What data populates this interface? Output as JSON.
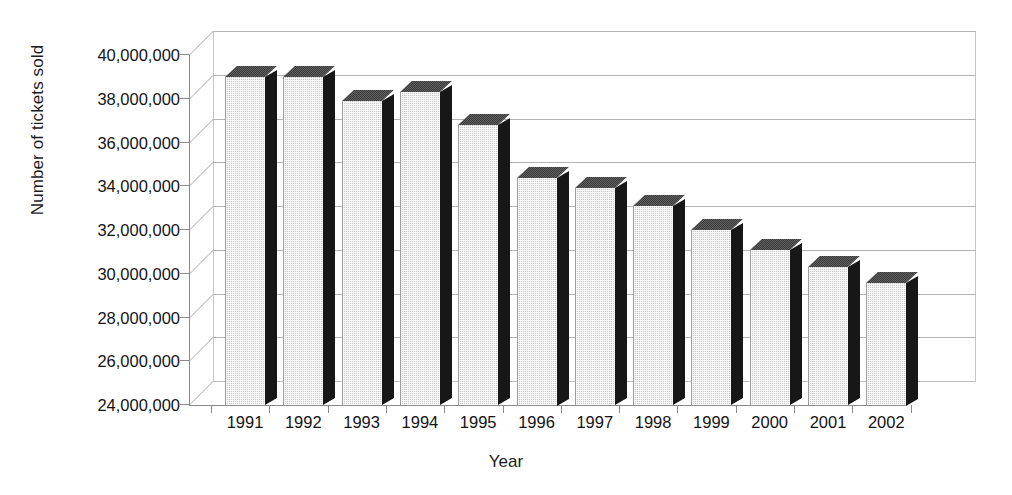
{
  "chart_data": {
    "type": "bar",
    "title": "",
    "xlabel": "Year",
    "ylabel": "Number of tickets sold",
    "categories": [
      "1991",
      "1992",
      "1993",
      "1994",
      "1995",
      "1996",
      "1997",
      "1998",
      "1999",
      "2000",
      "2001",
      "2002"
    ],
    "values": [
      39000000,
      39000000,
      37900000,
      38300000,
      36800000,
      34400000,
      33900000,
      33100000,
      32000000,
      31100000,
      30300000,
      29600000
    ],
    "ylim": [
      24000000,
      40000000
    ],
    "ytick_step": 2000000,
    "ytick_labels": [
      "40,000,000",
      "38,000,000",
      "36,000,000",
      "34,000,000",
      "32,000,000",
      "30,000,000",
      "28,000,000",
      "26,000,000",
      "24,000,000"
    ],
    "grid": true,
    "legend": "none",
    "style": "3d-column",
    "colors": {
      "bar_front": "#c9c9c9",
      "bar_side": "#171717",
      "bar_top": "#3c3c3c",
      "gridline": "#b4b4b4",
      "axis": "#8a8a8a",
      "text": "#141414",
      "background": "#ffffff"
    }
  }
}
